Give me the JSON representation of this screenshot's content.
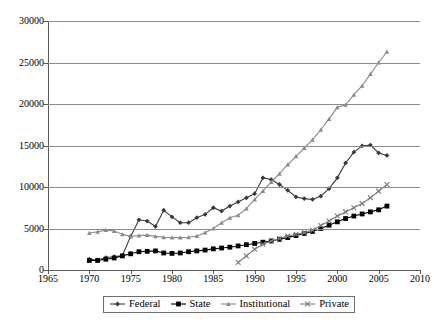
{
  "chart_data": {
    "type": "line",
    "title": "",
    "xlabel": "",
    "ylabel": "",
    "xlim": [
      1965,
      2010
    ],
    "ylim": [
      0,
      30000
    ],
    "ytick_values": [
      0,
      5000,
      10000,
      15000,
      20000,
      25000,
      30000
    ],
    "ytick_labels": [
      "0",
      "5000",
      "10000",
      "15000",
      "20000",
      "25000",
      "30000"
    ],
    "xtick_values": [
      1965,
      1970,
      1975,
      1980,
      1985,
      1990,
      1995,
      2000,
      2005,
      2010
    ],
    "xtick_labels": [
      "1965",
      "1970",
      "1975",
      "1980",
      "1985",
      "1990",
      "1995",
      "2000",
      "2005",
      "2010"
    ],
    "grid": "horizontal",
    "legend_position": "bottom-center",
    "series": [
      {
        "name": "Federal",
        "color": "#3a3a3a",
        "marker": "diamond",
        "x": [
          1970,
          1971,
          1972,
          1973,
          1974,
          1975,
          1976,
          1977,
          1978,
          1979,
          1980,
          1981,
          1982,
          1983,
          1984,
          1985,
          1986,
          1987,
          1988,
          1989,
          1990,
          1991,
          1992,
          1993,
          1994,
          1995,
          1996,
          1997,
          1998,
          1999,
          2000,
          2001,
          2002,
          2003,
          2004,
          2005,
          2006
        ],
        "y": [
          1300,
          1200,
          1500,
          1600,
          1750,
          4050,
          6050,
          5900,
          5250,
          7200,
          6400,
          5700,
          5700,
          6300,
          6700,
          7500,
          7100,
          7700,
          8200,
          8700,
          9200,
          11100,
          10900,
          10300,
          9600,
          8800,
          8600,
          8500,
          8900,
          9800,
          11100,
          12900,
          14200,
          14950,
          15050,
          14100,
          13800
        ]
      },
      {
        "name": "State",
        "color": "#000000",
        "marker": "square",
        "x": [
          1970,
          1971,
          1972,
          1973,
          1974,
          1975,
          1976,
          1977,
          1978,
          1979,
          1980,
          1981,
          1982,
          1983,
          1984,
          1985,
          1986,
          1987,
          1988,
          1989,
          1990,
          1991,
          1992,
          1993,
          1994,
          1995,
          1996,
          1997,
          1998,
          1999,
          2000,
          2001,
          2002,
          2003,
          2004,
          2005,
          2006
        ],
        "y": [
          1150,
          1150,
          1300,
          1450,
          1700,
          1950,
          2200,
          2250,
          2300,
          2050,
          2000,
          2050,
          2200,
          2300,
          2400,
          2550,
          2650,
          2750,
          2900,
          3050,
          3200,
          3350,
          3500,
          3700,
          3900,
          4150,
          4400,
          4650,
          5000,
          5400,
          5800,
          6200,
          6500,
          6750,
          7000,
          7250,
          7700
        ]
      },
      {
        "name": "Institutional",
        "color": "#8a8a8a",
        "marker": "triangle",
        "x": [
          1970,
          1971,
          1972,
          1973,
          1974,
          1975,
          1976,
          1977,
          1978,
          1979,
          1980,
          1981,
          1982,
          1983,
          1984,
          1985,
          1986,
          1987,
          1988,
          1989,
          1990,
          1991,
          1992,
          1993,
          1994,
          1995,
          1996,
          1997,
          1998,
          1999,
          2000,
          2001,
          2002,
          2003,
          2004,
          2005,
          2006
        ],
        "y": [
          4450,
          4600,
          4800,
          4700,
          4300,
          4050,
          4150,
          4200,
          4050,
          3950,
          3900,
          3900,
          3950,
          4100,
          4500,
          5000,
          5700,
          6300,
          6600,
          7400,
          8500,
          9500,
          10600,
          11600,
          12700,
          13700,
          14700,
          15700,
          16900,
          18200,
          19600,
          19900,
          21100,
          22200,
          23600,
          25000,
          26300
        ]
      },
      {
        "name": "Private",
        "color": "#7a7a7a",
        "marker": "x",
        "x": [
          1988,
          1989,
          1990,
          1991,
          1992,
          1993,
          1994,
          1995,
          1996,
          1997,
          1998,
          1999,
          2000,
          2001,
          2002,
          2003,
          2004,
          2005,
          2006
        ],
        "y": [
          900,
          1700,
          2500,
          3100,
          3500,
          3800,
          4100,
          4300,
          4500,
          4800,
          5350,
          5900,
          6500,
          7000,
          7500,
          8000,
          8700,
          9500,
          10300
        ]
      }
    ]
  },
  "legend": {
    "items": [
      {
        "label": "Federal"
      },
      {
        "label": "State"
      },
      {
        "label": "Institutional"
      },
      {
        "label": "Private"
      }
    ]
  }
}
